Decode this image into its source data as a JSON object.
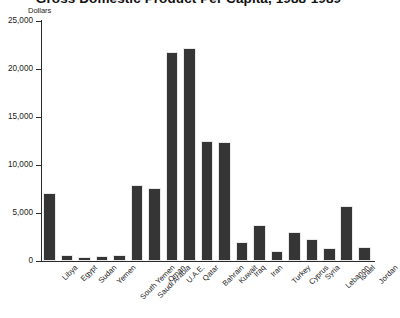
{
  "chart_data": {
    "type": "bar",
    "title": "Gross Domestic Product Per Capita, 1988-1989",
    "xlabel": "",
    "ylabel": "Dollars",
    "ylim": [
      0,
      25000
    ],
    "ytick_labels": [
      "0",
      "5,000",
      "10,000",
      "15,000",
      "20,000",
      "25,000"
    ],
    "ytick_values": [
      0,
      5000,
      10000,
      15000,
      20000,
      25000
    ],
    "grid": false,
    "legend": "none",
    "bar_color": "#353535",
    "axis_color": "#2a2a2a",
    "categories": [
      "Libya",
      "Egypt",
      "Sudan",
      "Yemen",
      "South Yemen",
      "Saudi Arabia",
      "Oman",
      "U.A.E.",
      "Qatar",
      "Bahrain",
      "Kuwait",
      "Iraq",
      "Iran",
      "Turkey",
      "Cyprus",
      "Syria",
      "Lebanon",
      "Israel",
      "Jordan"
    ],
    "values": [
      7100,
      650,
      450,
      550,
      600,
      7900,
      7600,
      21800,
      22200,
      12500,
      12400,
      2000,
      3700,
      1050,
      3000,
      2300,
      1350,
      5700,
      1500
    ]
  }
}
